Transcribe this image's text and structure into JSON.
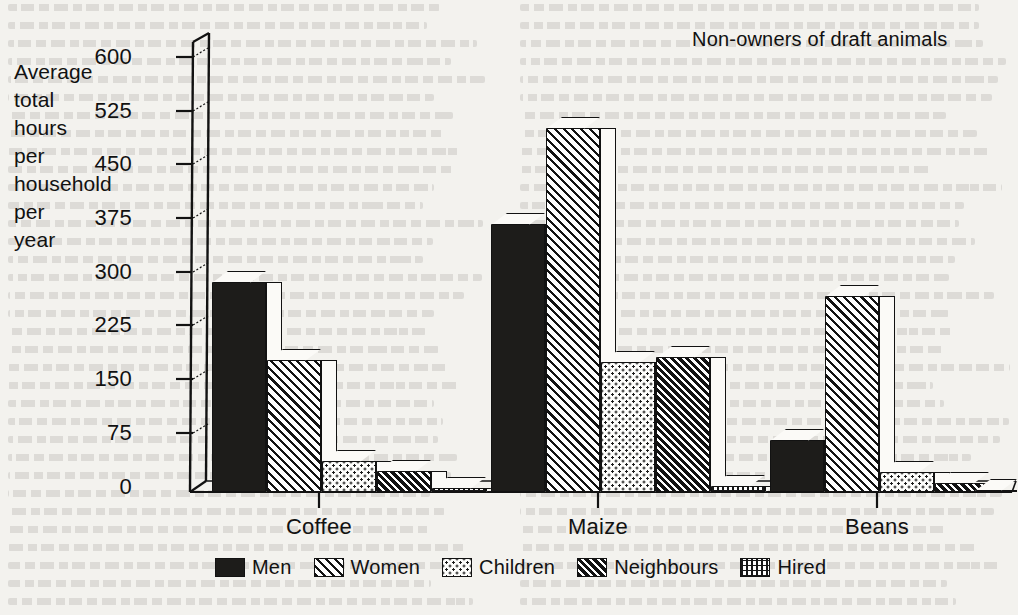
{
  "chart_data": {
    "type": "bar",
    "title": "Non-owners of draft animals",
    "ylabel": "Average\ntotal\nhours\nper\nhousehold\nper\nyear",
    "xlabel": "",
    "categories": [
      "Coffee",
      "Maize",
      "Beans"
    ],
    "yticks": [
      "0",
      "75",
      "150",
      "225",
      "300",
      "375",
      "450",
      "525",
      "600"
    ],
    "ylim": [
      0,
      600
    ],
    "grid": false,
    "legend_position": "bottom",
    "series": [
      {
        "name": "Men",
        "pattern": "solid-black",
        "values": [
          292,
          373,
          72
        ]
      },
      {
        "name": "Women",
        "pattern": "diagonal-left",
        "values": [
          184,
          507,
          273
        ]
      },
      {
        "name": "Children",
        "pattern": "dotted",
        "values": [
          43,
          181,
          28
        ]
      },
      {
        "name": "Neighbours",
        "pattern": "dense-hatch",
        "values": [
          29,
          188,
          12
        ]
      },
      {
        "name": "Hired",
        "pattern": "grid-fine",
        "values": [
          5,
          8,
          2
        ]
      }
    ]
  },
  "chart": {
    "title": "Non-owners of draft animals",
    "y_axis_title": "Average\ntotal\nhours\nper\nhousehold\nper\nyear",
    "y_ticks": [
      "600",
      "525",
      "450",
      "375",
      "300",
      "225",
      "150",
      "75",
      "0"
    ],
    "x_ticks": [
      "Coffee",
      "Maize",
      "Beans"
    ],
    "legend": [
      {
        "label": "Men"
      },
      {
        "label": "Women"
      },
      {
        "label": "Children"
      },
      {
        "label": "Neighbours"
      },
      {
        "label": "Hired"
      }
    ]
  },
  "colors": {
    "ink": "#121212",
    "paper": "#f3f2ee",
    "bar_fill_light": "#fbfaf7"
  }
}
